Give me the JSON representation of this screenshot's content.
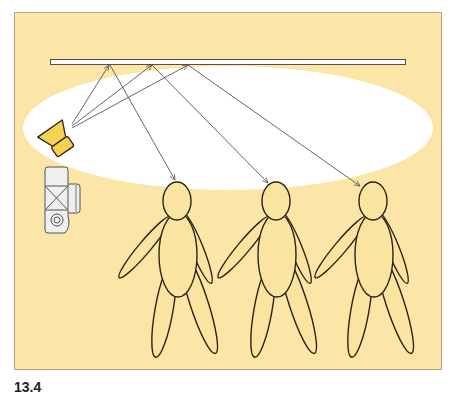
{
  "figure": {
    "caption": "13.4",
    "colors": {
      "background": "#fbe6a8",
      "frame_border": "#b8a37a",
      "light_spill": "#ffffff",
      "figure_fill": "#fbe3a0",
      "flash_fill": "#f6d251",
      "camera_fill": "#efefef",
      "arrow": "#555555",
      "outline": "#2a2418"
    },
    "elements": {
      "ceiling": "ceiling",
      "flash": "flash",
      "camera": "camera",
      "people": [
        "person-1",
        "person-2",
        "person-3"
      ],
      "ray_count": 3
    }
  }
}
